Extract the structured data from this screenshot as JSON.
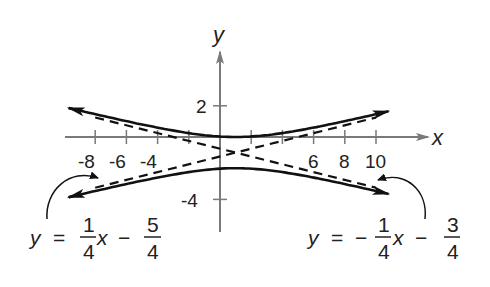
{
  "chart_data": {
    "type": "line",
    "title": "",
    "xlabel": "x",
    "ylabel": "y",
    "x_tick_labels": [
      "-8",
      "-6",
      "-4",
      "6",
      "8",
      "10"
    ],
    "x_ticks": [
      -8,
      -6,
      -4,
      -2,
      2,
      4,
      6,
      8,
      10
    ],
    "y_tick_labels": [
      "2",
      "-4"
    ],
    "y_ticks": [
      2,
      -4
    ],
    "xlim": [
      -10,
      13
    ],
    "ylim": [
      -6,
      5.5
    ],
    "grid": false,
    "legend": null,
    "series": [
      {
        "name": "hyperbola upper branch",
        "style": "solid",
        "equation": "(y+1)^2 - (x-1)^2/16 = 1, upper",
        "x_range": [
          -9.7,
          10.8
        ],
        "arrows": "both"
      },
      {
        "name": "hyperbola lower branch",
        "style": "solid",
        "equation": "(y+1)^2 - (x-1)^2/16 = 1, lower",
        "x_range": [
          -9.7,
          10.8
        ],
        "arrows": "both"
      },
      {
        "name": "asymptote 1",
        "style": "dashed",
        "equation": "y = 1/4 x - 5/4",
        "slope": 0.25,
        "intercept": -1.25,
        "x_range": [
          -8,
          10
        ]
      },
      {
        "name": "asymptote 2",
        "style": "dashed",
        "equation": "y = -1/4 x - 3/4",
        "slope": -0.25,
        "intercept": -0.75,
        "x_range": [
          -8,
          10
        ]
      }
    ],
    "annotations": [
      {
        "text": "y = 1/4 x − 5/4",
        "points_to": "asymptote 1 (lower left)",
        "parts": {
          "lhs": "y",
          "eq": "=",
          "num1": "1",
          "den1": "4",
          "var": "x",
          "op": "−",
          "num2": "5",
          "den2": "4"
        }
      },
      {
        "text": "y = −1/4 x − 3/4",
        "points_to": "asymptote 2 (lower right)",
        "parts": {
          "lhs": "y",
          "eq": "=",
          "sign": "−",
          "num1": "1",
          "den1": "4",
          "var": "x",
          "op": "−",
          "num2": "3",
          "den2": "4"
        }
      }
    ],
    "colors": {
      "axis": "#7a7a7a",
      "curve": "#111111",
      "text": "#222222"
    }
  }
}
